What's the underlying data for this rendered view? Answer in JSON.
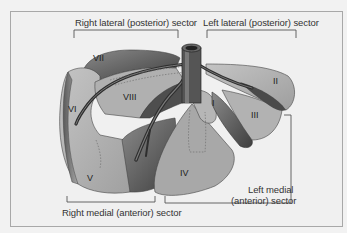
{
  "diagram": {
    "sector_labels": {
      "right_lateral": "Right lateral (posterior) sector",
      "left_lateral": "Left lateral (posterior) sector",
      "right_medial": "Right medial (anterior) sector",
      "left_medial_line1": "Left medial",
      "left_medial_line2": "(anterior) sector"
    },
    "segments": {
      "I": "I",
      "II": "II",
      "III": "III",
      "IV": "IV",
      "V": "V",
      "VI": "VI",
      "VII": "VII",
      "VIII": "VIII"
    },
    "colors": {
      "background": "#f0f0f0",
      "frame_border": "#a8a8a8",
      "lobe_light": "#b8b8b8",
      "lobe_mid": "#9a9a9a",
      "lobe_dark": "#5a5a5a",
      "vein": "#3a3a3a",
      "bracket": "#555555"
    }
  }
}
